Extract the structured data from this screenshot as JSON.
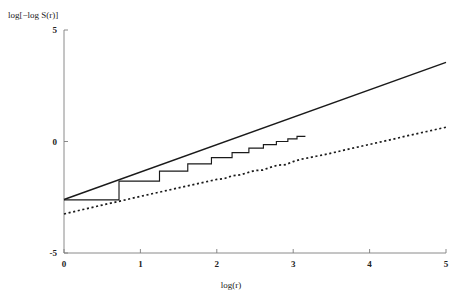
{
  "chart_data": {
    "type": "line",
    "title": "",
    "xlabel": "log(r)",
    "ylabel": "log[−log S(r)]",
    "xlim": [
      0,
      5
    ],
    "ylim": [
      -5,
      5
    ],
    "xticks": [
      0,
      1,
      2,
      3,
      4,
      5
    ],
    "xtick_labels": [
      "0",
      "1",
      "2",
      "3",
      "4",
      "5"
    ],
    "yticks": [
      -5,
      0,
      5
    ],
    "ytick_labels": [
      "-5",
      "0",
      "5"
    ],
    "grid": false,
    "legend": "none",
    "axis_style": "left-and-bottom-spines",
    "series": [
      {
        "name": "fitted-line-solid",
        "style": "solid",
        "x": [
          0,
          5
        ],
        "values": [
          -2.6,
          3.55
        ]
      },
      {
        "name": "empirical-step-function",
        "style": "step-post",
        "x": [
          0.0,
          0.72,
          0.72,
          1.25,
          1.25,
          1.62,
          1.62,
          1.93,
          1.93,
          2.2,
          2.2,
          2.42,
          2.42,
          2.61,
          2.61,
          2.78,
          2.78,
          2.93,
          2.93,
          3.05,
          3.05,
          3.16
        ],
        "values": [
          -2.62,
          -2.62,
          -1.78,
          -1.78,
          -1.33,
          -1.33,
          -1.0,
          -1.0,
          -0.72,
          -0.72,
          -0.5,
          -0.5,
          -0.3,
          -0.3,
          -0.14,
          -0.14,
          0.0,
          0.0,
          0.12,
          0.12,
          0.23,
          0.23
        ]
      },
      {
        "name": "comparison-curve-dotted",
        "style": "dotted",
        "x": [
          0.0,
          0.25,
          0.5,
          0.75,
          1.0,
          1.25,
          1.5,
          1.75,
          2.0,
          2.1,
          2.2,
          2.3,
          2.4,
          2.5,
          2.6,
          2.7,
          2.8,
          2.9,
          3.0,
          3.1,
          3.2,
          3.3,
          3.4,
          3.5,
          3.75,
          4.0,
          4.25,
          4.5,
          4.75,
          5.0
        ],
        "values": [
          -3.25,
          -3.05,
          -2.85,
          -2.66,
          -2.46,
          -2.27,
          -2.08,
          -1.89,
          -1.7,
          -1.66,
          -1.54,
          -1.5,
          -1.4,
          -1.3,
          -1.28,
          -1.16,
          -1.06,
          -1.04,
          -0.9,
          -0.8,
          -0.73,
          -0.66,
          -0.6,
          -0.52,
          -0.32,
          -0.13,
          0.06,
          0.26,
          0.45,
          0.64
        ]
      }
    ]
  },
  "colors": {
    "line": "#1a1a1a",
    "axis": "#7d7d7d",
    "background": "#ffffff"
  }
}
